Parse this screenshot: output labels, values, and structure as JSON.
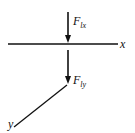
{
  "diagram": {
    "forces": [
      {
        "symbol": "F",
        "subscript": "lx"
      },
      {
        "symbol": "F",
        "subscript": "ly"
      }
    ],
    "axes": {
      "x": "x",
      "y": "y"
    },
    "color": "#111111"
  }
}
